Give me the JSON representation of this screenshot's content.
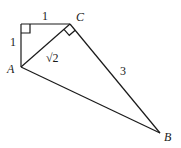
{
  "diagram": {
    "points": {
      "D": {
        "x": 21,
        "y": 24
      },
      "C": {
        "x": 70,
        "y": 24,
        "label": "C"
      },
      "A": {
        "x": 21,
        "y": 67,
        "label": "A"
      },
      "B": {
        "x": 160,
        "y": 133,
        "label": "B"
      }
    },
    "segment_labels": {
      "top": "1",
      "left": "1",
      "AC": "√2",
      "CB": "3"
    },
    "right_angles": [
      "at top-left corner",
      "at C (angle ACB)"
    ],
    "stroke_color": "#1a1a1a"
  }
}
